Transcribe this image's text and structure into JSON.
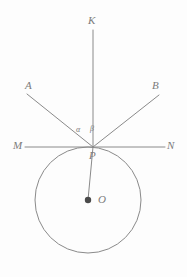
{
  "figure": {
    "type": "geometry-diagram",
    "background_color": "#fdfdfd",
    "stroke_color": "#8a8a8a",
    "label_color": "#7b7b7b",
    "dot_color": "#4a4a4a",
    "labels": {
      "K": "K",
      "A": "A",
      "B": "B",
      "M": "M",
      "N": "N",
      "P": "P",
      "O": "O",
      "alpha": "α",
      "beta": "β"
    },
    "points": {
      "P": {
        "x": 93,
        "y": 147
      },
      "O": {
        "x": 88,
        "y": 200
      },
      "K_end": {
        "x": 93,
        "y": 30
      },
      "A_end": {
        "x": 27,
        "y": 94
      },
      "B_end": {
        "x": 159,
        "y": 95
      },
      "M_end": {
        "x": 25,
        "y": 147
      },
      "N_end": {
        "x": 165,
        "y": 147
      }
    },
    "circle": {
      "cx": 88,
      "cy": 200,
      "r": 53
    },
    "segments": [
      {
        "name": "line-MN",
        "x1": 25,
        "y1": 147,
        "x2": 165,
        "y2": 147
      },
      {
        "name": "ray-PK",
        "x1": 93,
        "y1": 147,
        "x2": 93,
        "y2": 30
      },
      {
        "name": "ray-PA",
        "x1": 93,
        "y1": 147,
        "x2": 27,
        "y2": 94
      },
      {
        "name": "ray-PB",
        "x1": 93,
        "y1": 147,
        "x2": 159,
        "y2": 95
      },
      {
        "name": "radius-PO",
        "x1": 93,
        "y1": 147,
        "x2": 88,
        "y2": 200
      }
    ]
  }
}
